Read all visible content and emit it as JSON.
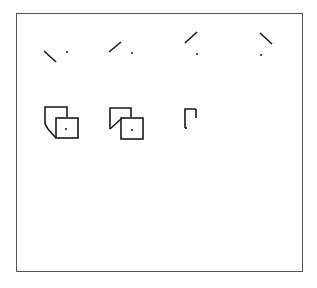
{
  "figure": {
    "panels": [
      {
        "id": "A",
        "caption": "A.  Single Lines",
        "items": [
          "line-down-right-with-dot",
          "line-up-right-with-dot",
          "line-up-right-above-dot",
          "line-down-right-above-dot"
        ]
      },
      {
        "id": "B",
        "caption": "B.  3-D Objects",
        "items": [
          "folded-square-bottom-left",
          "folded-square-inner-left",
          "folded-square-top-right",
          "folded-square-top-right-corner"
        ]
      },
      {
        "id": "C",
        "caption": "C.  2-D Lines",
        "items": [
          "line-grid-diag-down-right",
          "line-grid-diag-up-right",
          "line-grid-diag-checkmark",
          "line-grid-diag-top-right"
        ]
      }
    ],
    "colors": {
      "stroke": "#1a1a1a",
      "border": "#555555",
      "background": "#ffffff"
    }
  }
}
